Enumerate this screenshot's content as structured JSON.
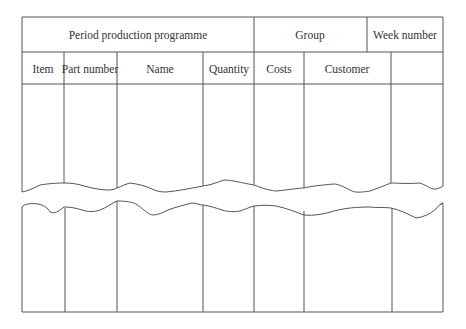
{
  "form": {
    "title": "Period production programme",
    "group_label": "Group",
    "week_label": "Week number",
    "columns": [
      {
        "label": "Item"
      },
      {
        "label": "Part number"
      },
      {
        "label": "Name"
      },
      {
        "label": "Quantity"
      },
      {
        "label": "Costs"
      },
      {
        "label": "Customer"
      },
      {
        "label": ""
      }
    ]
  },
  "colors": {
    "line": "#555555",
    "background": "#ffffff"
  }
}
